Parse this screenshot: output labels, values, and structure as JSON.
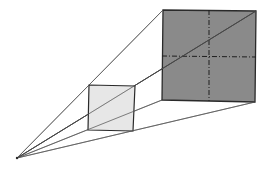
{
  "diagram": {
    "type": "perspective-projection",
    "colors": {
      "background": "#ffffff",
      "large_square_fill": "#8a8a8a",
      "small_square_fill": "#e4e4e4",
      "stroke": "#2a2a2a",
      "ray": "#555555",
      "dashed": "#1e1e1e"
    },
    "apex": {
      "x": 17,
      "y": 158
    },
    "small_square": {
      "corners": [
        [
          89,
          85
        ],
        [
          135,
          86
        ],
        [
          133,
          131
        ],
        [
          88,
          130
        ]
      ]
    },
    "large_square": {
      "corners": [
        [
          163,
          10
        ],
        [
          256,
          11
        ],
        [
          255,
          102
        ],
        [
          162,
          100
        ]
      ],
      "dashed_vertical": [
        [
          209,
          10
        ],
        [
          209,
          101
        ]
      ],
      "dashed_horizontal": [
        [
          162,
          56
        ],
        [
          256,
          57
        ]
      ]
    },
    "rays": [
      {
        "to": [
          163,
          10
        ]
      },
      {
        "to": [
          256,
          11
        ]
      },
      {
        "to": [
          162,
          100
        ]
      },
      {
        "to": [
          255,
          102
        ]
      }
    ]
  }
}
